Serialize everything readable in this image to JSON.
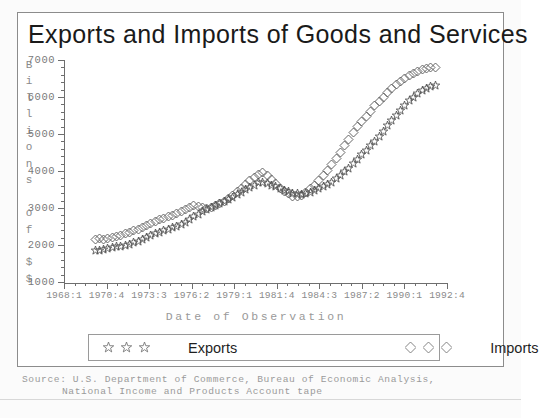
{
  "chart_data": {
    "type": "line",
    "title": "Exports and Imports of Goods and Services",
    "xlabel": "Date of Observation",
    "ylabel": "Billions of $$",
    "ylim": [
      1000,
      7000
    ],
    "yticks": [
      1000,
      2000,
      3000,
      4000,
      5000,
      6000,
      7000
    ],
    "xticklabels": [
      "1968:1",
      "1970:4",
      "1973:3",
      "1976:2",
      "1979:1",
      "1981:4",
      "1984:3",
      "1987:2",
      "1990:1",
      "1992:4"
    ],
    "grid": false,
    "legend_position": "below-axes",
    "series": [
      {
        "name": "Exports",
        "marker": "star",
        "color": "#555555",
        "x_start": "1970:1",
        "values": [
          1840,
          1860,
          1880,
          1900,
          1930,
          1950,
          1960,
          1990,
          2020,
          2060,
          2100,
          2150,
          2200,
          2260,
          2310,
          2340,
          2380,
          2420,
          2460,
          2500,
          2560,
          2620,
          2700,
          2760,
          2820,
          2900,
          2960,
          3010,
          3080,
          3120,
          3180,
          3230,
          3290,
          3360,
          3430,
          3500,
          3560,
          3620,
          3680,
          3700,
          3660,
          3620,
          3580,
          3520,
          3470,
          3440,
          3400,
          3380,
          3360,
          3380,
          3420,
          3470,
          3520,
          3580,
          3640,
          3700,
          3790,
          3880,
          3980,
          4080,
          4200,
          4320,
          4440,
          4560,
          4680,
          4800,
          4940,
          5080,
          5220,
          5360,
          5500,
          5640,
          5780,
          5900,
          6000,
          6100,
          6180,
          6240,
          6280,
          6300
        ],
        "value_at_peak": 6300
      },
      {
        "name": "Imports",
        "marker": "diamond",
        "color": "#555555",
        "x_start": "1970:1",
        "values": [
          2150,
          2170,
          2160,
          2180,
          2200,
          2230,
          2260,
          2300,
          2340,
          2380,
          2420,
          2470,
          2520,
          2580,
          2640,
          2690,
          2720,
          2760,
          2800,
          2850,
          2900,
          2960,
          3020,
          3060,
          3040,
          3020,
          3000,
          3020,
          3060,
          3120,
          3180,
          3260,
          3340,
          3440,
          3540,
          3640,
          3740,
          3820,
          3900,
          3960,
          3880,
          3780,
          3660,
          3540,
          3440,
          3380,
          3320,
          3300,
          3340,
          3420,
          3520,
          3620,
          3740,
          3880,
          4020,
          4180,
          4340,
          4500,
          4680,
          4860,
          5040,
          5200,
          5340,
          5480,
          5620,
          5760,
          5880,
          6000,
          6120,
          6240,
          6340,
          6420,
          6500,
          6580,
          6640,
          6700,
          6740,
          6780,
          6800,
          6800
        ],
        "value_at_peak": 6800
      }
    ]
  },
  "legend": {
    "entries": [
      {
        "label": "Exports",
        "marker": "star",
        "count": 3
      },
      {
        "label": "Imports",
        "marker": "diamond",
        "count": 3
      }
    ]
  },
  "source": {
    "line1": "Source: U.S. Department of Commerce, Bureau of Economic Analysis,",
    "line2": "National Income and Products Account tape"
  },
  "ylabel_chars": [
    "B",
    "i",
    "l",
    "l",
    "i",
    "o",
    "n",
    "s",
    "",
    "o",
    "f",
    "",
    "$",
    "$"
  ]
}
